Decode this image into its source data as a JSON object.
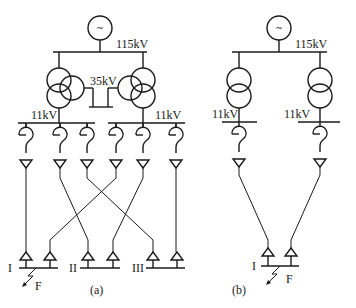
{
  "diagram_a": {
    "caption": "(a)",
    "generator_symbol": "~",
    "hv_bus_label": "115kV",
    "mv_bus_label": "35kV",
    "lv_bus_left_label": "11kV",
    "lv_bus_right_label": "11kV",
    "load_bus_labels": [
      "I",
      "II",
      "III"
    ],
    "fault_label": "F"
  },
  "diagram_b": {
    "caption": "(b)",
    "generator_symbol": "~",
    "hv_bus_label": "115kV",
    "lv_bus_left_label": "11kV",
    "lv_bus_right_label": "11kV",
    "load_bus_labels": [
      "I"
    ],
    "fault_label": "F"
  }
}
